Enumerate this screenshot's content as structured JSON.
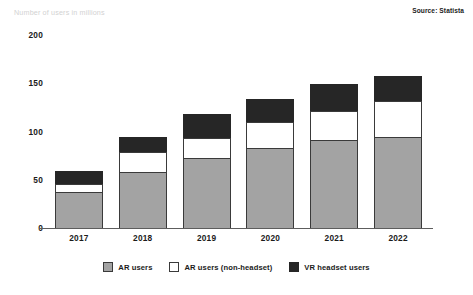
{
  "chart_data": {
    "type": "bar",
    "subtype": "stacked-bar",
    "title": "",
    "axis_caption": "Number of users in millions",
    "source": "Source: Statista",
    "xlabel": "",
    "ylabel": "Number of users in millions",
    "categories": [
      "2017",
      "2018",
      "2019",
      "2020",
      "2021",
      "2022"
    ],
    "ylim": [
      0,
      200
    ],
    "yticks": [
      0,
      50,
      100,
      150,
      200
    ],
    "ytick_labels": [
      "0",
      "50",
      "100",
      "150",
      "200"
    ],
    "grid": false,
    "legend_position": "bottom",
    "series": [
      {
        "name": "AR users",
        "color": "#a3a3a3",
        "values": [
          37,
          58,
          73,
          83,
          91,
          94
        ]
      },
      {
        "name": "AR users (non-headset)",
        "color": "#ffffff",
        "values": [
          9,
          21,
          20,
          27,
          30,
          38
        ]
      },
      {
        "name": "VR headset users",
        "color": "#262626",
        "values": [
          13,
          15,
          25,
          24,
          28,
          26
        ]
      }
    ],
    "totals": [
      59,
      94,
      118,
      134,
      149,
      158
    ]
  }
}
